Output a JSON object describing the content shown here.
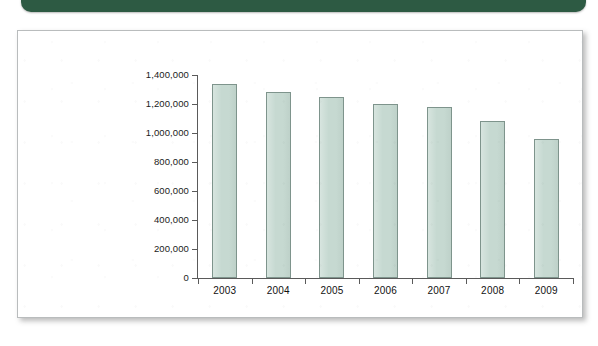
{
  "banner": {
    "name": "header-band",
    "color": "#2d5a43"
  },
  "card": {
    "background": "#ffffff",
    "border_color": "#b9bcbd"
  },
  "chart_data": {
    "type": "bar",
    "title": "",
    "subtitle": "",
    "xlabel": "",
    "ylabel": "",
    "categories": [
      "2003",
      "2004",
      "2005",
      "2006",
      "2007",
      "2008",
      "2009"
    ],
    "values": [
      1340000,
      1280000,
      1250000,
      1200000,
      1180000,
      1080000,
      960000
    ],
    "ylim": [
      0,
      1400000
    ],
    "ytick_values": [
      0,
      200000,
      400000,
      600000,
      800000,
      1000000,
      1200000,
      1400000
    ],
    "ytick_labels": [
      "0",
      "200,000",
      "400,000",
      "600,000",
      "800,000",
      "1,000,000",
      "1,200,000",
      "1,400,000"
    ],
    "grid": false,
    "legend": false,
    "legend_position": "none",
    "bar_fill_color": "#c6d9d1",
    "bar_edge_color": "#7e948c",
    "axis_color": "#5a5a5a",
    "tick_label_color": "#111111"
  }
}
